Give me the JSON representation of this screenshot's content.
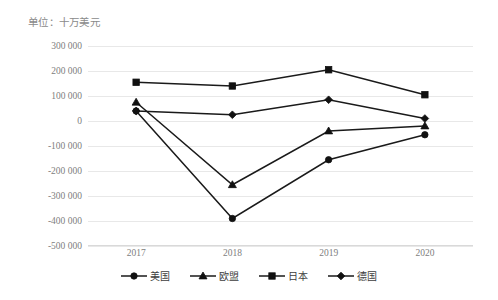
{
  "unit_caption": "单位：十万美元",
  "chart_data": {
    "type": "line",
    "title": "单位：十万美元",
    "xlabel": "",
    "ylabel": "",
    "categories": [
      "2017",
      "2018",
      "2019",
      "2020"
    ],
    "ylim": [
      -500000,
      300000
    ],
    "ytick_step": 100000,
    "ytick_labels": [
      "300 000",
      "200 000",
      "100 000",
      "0",
      "-100 000",
      "-200 000",
      "-300 000",
      "-400 000",
      "-500 000"
    ],
    "ytick_values": [
      300000,
      200000,
      100000,
      0,
      -100000,
      -200000,
      -300000,
      -400000,
      -500000
    ],
    "grid": true,
    "legend_position": "bottom",
    "series": [
      {
        "name": "美国",
        "marker": "circle",
        "values": [
          40000,
          -390000,
          -155000,
          -55000
        ]
      },
      {
        "name": "欧盟",
        "marker": "triangle",
        "values": [
          75000,
          -255000,
          -40000,
          -20000
        ]
      },
      {
        "name": "日本",
        "marker": "square",
        "values": [
          155000,
          140000,
          205000,
          105000
        ]
      },
      {
        "name": "德国",
        "marker": "diamond",
        "values": [
          40000,
          25000,
          85000,
          10000
        ]
      }
    ]
  },
  "legend": {
    "items": [
      {
        "label": "美国",
        "marker": "circle"
      },
      {
        "label": "欧盟",
        "marker": "triangle"
      },
      {
        "label": "日本",
        "marker": "square"
      },
      {
        "label": "德国",
        "marker": "diamond"
      }
    ]
  },
  "colors": {
    "line": "#1a1a1a",
    "marker": "#111111",
    "grid": "#e8e8e8",
    "tick_text": "#808080",
    "caption_text": "#8a8a8a"
  }
}
